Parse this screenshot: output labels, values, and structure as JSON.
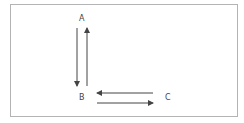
{
  "diagram": {
    "nodes": [
      {
        "id": "A",
        "label": "A",
        "x": 79,
        "y": 15
      },
      {
        "id": "B",
        "label": "B",
        "x": 79,
        "y": 94
      },
      {
        "id": "C",
        "label": "C",
        "x": 165,
        "y": 94
      }
    ],
    "edges": [
      {
        "from": "A",
        "to": "B",
        "direction": "down"
      },
      {
        "from": "B",
        "to": "A",
        "direction": "up"
      },
      {
        "from": "C",
        "to": "B",
        "direction": "left"
      },
      {
        "from": "B",
        "to": "C",
        "direction": "right"
      }
    ],
    "colors": {
      "frame_border": "#b4b4b4",
      "arrow": "#444444",
      "label": "#444444"
    }
  }
}
